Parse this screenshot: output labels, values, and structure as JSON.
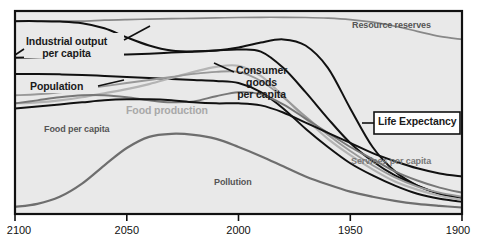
{
  "chart_data": {
    "type": "line",
    "title": "",
    "subtitle": "",
    "xlabel": "",
    "ylabel": "",
    "grid": false,
    "legend_position": "inline-annotations",
    "x_axis_reversed": true,
    "xlim": [
      2100,
      1900
    ],
    "ylim": [
      0,
      1
    ],
    "x_ticks": [
      2100,
      2050,
      2000,
      1950,
      1900
    ],
    "x_tick_labels": [
      "2100",
      "2050",
      "2000",
      "1950",
      "1900"
    ],
    "y_ticks": [],
    "y_tick_labels": [],
    "x": [
      2100,
      2090,
      2080,
      2070,
      2060,
      2050,
      2040,
      2030,
      2020,
      2010,
      2000,
      1990,
      1980,
      1970,
      1960,
      1950,
      1940,
      1930,
      1920,
      1910,
      1900
    ],
    "series": [
      {
        "name": "Resource reserves",
        "color": "#888888",
        "width": 1.7,
        "label_style": "mid",
        "values": [
          0.95,
          0.95,
          0.95,
          0.95,
          0.955,
          0.958,
          0.96,
          0.962,
          0.964,
          0.966,
          0.968,
          0.969,
          0.969,
          0.968,
          0.965,
          0.958,
          0.945,
          0.925,
          0.9,
          0.875,
          0.86
        ]
      },
      {
        "name": "Industrial output per capita",
        "color": "#111111",
        "width": 2.0,
        "label_style": "dark",
        "values": [
          0.95,
          0.95,
          0.948,
          0.94,
          0.915,
          0.87,
          0.83,
          0.805,
          0.8,
          0.805,
          0.82,
          0.845,
          0.86,
          0.83,
          0.72,
          0.52,
          0.33,
          0.21,
          0.14,
          0.1,
          0.08
        ]
      },
      {
        "name": "Consumer goods per capita",
        "color": "#111111",
        "width": 2.0,
        "label_style": "dark",
        "values": [
          0.77,
          0.772,
          0.775,
          0.778,
          0.782,
          0.786,
          0.79,
          0.795,
          0.8,
          0.805,
          0.81,
          0.8,
          0.72,
          0.6,
          0.47,
          0.35,
          0.26,
          0.19,
          0.14,
          0.1,
          0.08
        ]
      },
      {
        "name": "Population",
        "color": "#111111",
        "width": 2.0,
        "label_style": "dark",
        "values": [
          0.69,
          0.69,
          0.688,
          0.685,
          0.68,
          0.675,
          0.67,
          0.665,
          0.66,
          0.655,
          0.645,
          0.6,
          0.52,
          0.42,
          0.33,
          0.25,
          0.19,
          0.14,
          0.1,
          0.075,
          0.06
        ]
      },
      {
        "name": "Food production",
        "color": "#b4b4b4",
        "width": 2.2,
        "label_style": "light",
        "values": [
          0.545,
          0.55,
          0.56,
          0.575,
          0.595,
          0.615,
          0.64,
          0.67,
          0.7,
          0.725,
          0.73,
          0.68,
          0.58,
          0.47,
          0.37,
          0.29,
          0.22,
          0.16,
          0.12,
          0.09,
          0.07
        ]
      },
      {
        "name": "Services per capita",
        "color": "#999999",
        "width": 1.9,
        "label_style": "grey",
        "values": [
          0.585,
          0.59,
          0.6,
          0.615,
          0.63,
          0.645,
          0.66,
          0.675,
          0.69,
          0.7,
          0.7,
          0.655,
          0.575,
          0.48,
          0.39,
          0.31,
          0.24,
          0.18,
          0.135,
          0.105,
          0.085
        ]
      },
      {
        "name": "Food per capita",
        "color": "#777777",
        "width": 1.9,
        "label_style": "mid",
        "values": [
          0.545,
          0.56,
          0.575,
          0.585,
          0.585,
          0.575,
          0.56,
          0.55,
          0.555,
          0.58,
          0.6,
          0.59,
          0.54,
          0.47,
          0.4,
          0.33,
          0.27,
          0.21,
          0.165,
          0.13,
          0.105
        ]
      },
      {
        "name": "Pollution",
        "color": "#6e6e6e",
        "width": 2.2,
        "label_style": "mid",
        "values": [
          0.035,
          0.05,
          0.085,
          0.15,
          0.24,
          0.325,
          0.38,
          0.395,
          0.39,
          0.37,
          0.33,
          0.285,
          0.235,
          0.185,
          0.145,
          0.11,
          0.085,
          0.065,
          0.05,
          0.04,
          0.032
        ]
      },
      {
        "name": "Life Expectancy",
        "color": "#111111",
        "width": 2.0,
        "label_style": "dark",
        "values": [
          0.52,
          0.53,
          0.54,
          0.55,
          0.56,
          0.565,
          0.565,
          0.56,
          0.55,
          0.545,
          0.545,
          0.535,
          0.5,
          0.45,
          0.4,
          0.35,
          0.3,
          0.26,
          0.225,
          0.2,
          0.185
        ]
      }
    ],
    "annotations": [
      {
        "name": "industrial-output",
        "text": "Industrial output\nper capita",
        "style": "dark"
      },
      {
        "name": "population",
        "text": "Population",
        "style": "dark"
      },
      {
        "name": "food-per-capita",
        "text": "Food per capita",
        "style": "mid"
      },
      {
        "name": "food-production",
        "text": "Food production",
        "style": "light"
      },
      {
        "name": "consumer-goods",
        "text": "Consumer\ngoods\nper capita",
        "style": "dark"
      },
      {
        "name": "resource-reserves",
        "text": "Resource reserves",
        "style": "mid"
      },
      {
        "name": "life-expectancy",
        "text": "Life Expectancy",
        "style": "dark"
      },
      {
        "name": "services-per-capita",
        "text": "Services per capita",
        "style": "grey"
      },
      {
        "name": "pollution",
        "text": "Pollution",
        "style": "mid"
      }
    ],
    "colors": {
      "plot_background": "#e9e9e9",
      "axis": "#111111",
      "dark_curve": "#111111",
      "mid_curve": "#777777",
      "light_curve": "#b4b4b4"
    }
  },
  "labels": {
    "industrial_output_line1": "Industrial output",
    "industrial_output_line2": "per capita",
    "population": "Population",
    "food_per_capita": "Food per capita",
    "food_production": "Food production",
    "consumer_goods_line1": "Consumer",
    "consumer_goods_line2": "goods",
    "consumer_goods_line3": "per capita",
    "resource_reserves": "Resource reserves",
    "life_expectancy": "Life Expectancy",
    "services_per_capita": "Services per capita",
    "pollution": "Pollution"
  },
  "axis": {
    "tick_2100": "2100",
    "tick_2050": "2050",
    "tick_2000": "2000",
    "tick_1950": "1950",
    "tick_1900": "1900"
  }
}
